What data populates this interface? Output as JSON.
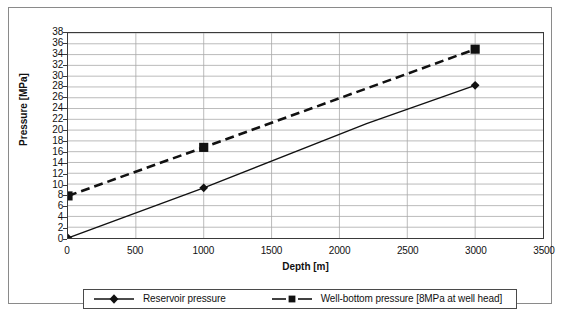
{
  "chart_data": {
    "type": "line",
    "title": "",
    "xlabel": "Depth [m]",
    "ylabel": "Pressure [MPa]",
    "xlim": [
      0,
      3500
    ],
    "ylim": [
      0,
      38
    ],
    "xticks": [
      0,
      500,
      1000,
      1500,
      2000,
      2500,
      3000,
      3500
    ],
    "yticks": [
      0,
      2,
      4,
      6,
      8,
      10,
      12,
      14,
      16,
      18,
      20,
      22,
      24,
      26,
      28,
      30,
      32,
      34,
      36,
      38
    ],
    "grid": "horizontal-and-vertical",
    "legend_position": "bottom",
    "series": [
      {
        "name": "Reservoir pressure",
        "marker": "diamond",
        "linestyle": "solid",
        "color": "#111111",
        "x": [
          0,
          1000,
          2200,
          3000
        ],
        "y": [
          0,
          9.3,
          21.2,
          28.3
        ],
        "markers_at": [
          0,
          1000,
          3000
        ]
      },
      {
        "name": "Well-bottom pressure [8MPa at well head]",
        "marker": "square",
        "linestyle": "dashed",
        "color": "#111111",
        "x": [
          0,
          1000,
          3000
        ],
        "y": [
          7.8,
          16.8,
          35.0
        ],
        "markers_at": [
          0,
          1000,
          3000
        ]
      }
    ]
  },
  "legend": {
    "entries": [
      {
        "label": "Reservoir pressure",
        "marker": "diamond-marker-icon",
        "linestyle": "solid"
      },
      {
        "label": "Well-bottom pressure [8MPa at well head]",
        "marker": "square-marker-icon",
        "linestyle": "dashed"
      }
    ]
  },
  "axes": {
    "y_title": "Pressure [MPa]",
    "x_title": "Depth [m]",
    "y_tick_labels": [
      "38",
      "36",
      "34",
      "32",
      "30",
      "28",
      "26",
      "24",
      "22",
      "20",
      "18",
      "16",
      "14",
      "12",
      "10",
      "8",
      "6",
      "4",
      "2",
      "0"
    ],
    "x_tick_labels": [
      "0",
      "500",
      "1000",
      "1500",
      "2000",
      "2500",
      "3000",
      "3500"
    ]
  },
  "colors": {
    "ink": "#111111",
    "grid": "#a9a9a9",
    "axis": "#3a3a3a",
    "frame": "#8a8a8a",
    "background": "#ffffff"
  }
}
